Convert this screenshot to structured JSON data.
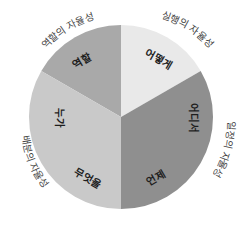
{
  "diagram": {
    "type": "segmented-wheel",
    "center": [
      121,
      117
    ],
    "radius": 92,
    "segments": [
      {
        "id": "role",
        "label": "역할",
        "start_deg": 300,
        "end_deg": 360,
        "color": "#a9a9a9"
      },
      {
        "id": "how",
        "label": "어떻게",
        "start_deg": 0,
        "end_deg": 60,
        "color": "#e9e9e9"
      },
      {
        "id": "where_when",
        "start_deg": 60,
        "end_deg": 180,
        "color": "#8f8f8f"
      },
      {
        "id": "who_what",
        "start_deg": 180,
        "end_deg": 300,
        "color": "#c9c9c9"
      }
    ],
    "inner_labels": {
      "role": "역할",
      "how": "어떻게",
      "where": "어디서",
      "when": "언제",
      "what": "무엇을",
      "who": "누가"
    },
    "outer_labels": {
      "role_autonomy": "역할의 자율성",
      "execution_autonomy": "실행의 자율성",
      "schedule_autonomy": "일정의 자율성",
      "configuration_autonomy": "배분의 자율성"
    }
  }
}
